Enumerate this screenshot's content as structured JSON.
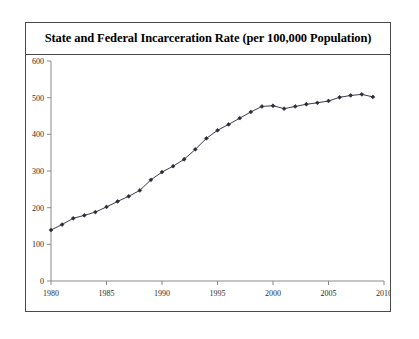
{
  "figure": {
    "title": "State and Federal Incarceration Rate (per 100,000 Population)",
    "frame_color": "#4a4a4a",
    "background": "#ffffff"
  },
  "chart_data": {
    "type": "line",
    "title": "State and Federal Incarceration Rate (per 100,000 Population)",
    "xlabel": "",
    "ylabel": "",
    "xlim": [
      1980,
      2010
    ],
    "ylim": [
      0,
      600
    ],
    "xticks": [
      1980,
      1985,
      1990,
      1995,
      2000,
      2005,
      2010
    ],
    "yticks": [
      0,
      100,
      200,
      300,
      400,
      500,
      600
    ],
    "grid": false,
    "legend": false,
    "marker": "diamond",
    "line_color": "#3a3a4a",
    "marker_color": "#2a2a38",
    "x": [
      1980,
      1981,
      1982,
      1983,
      1984,
      1985,
      1986,
      1987,
      1988,
      1989,
      1990,
      1991,
      1992,
      1993,
      1994,
      1995,
      1996,
      1997,
      1998,
      1999,
      2000,
      2001,
      2002,
      2003,
      2004,
      2005,
      2006,
      2007,
      2008,
      2009
    ],
    "values": [
      139,
      154,
      171,
      179,
      188,
      202,
      217,
      231,
      247,
      276,
      297,
      313,
      332,
      359,
      389,
      411,
      427,
      444,
      461,
      476,
      478,
      470,
      476,
      482,
      486,
      491,
      501,
      506,
      509,
      502
    ],
    "series": [
      {
        "name": "State and Federal Incarceration Rate",
        "values": [
          139,
          154,
          171,
          179,
          188,
          202,
          217,
          231,
          247,
          276,
          297,
          313,
          332,
          359,
          389,
          411,
          427,
          444,
          461,
          476,
          478,
          470,
          476,
          482,
          486,
          491,
          501,
          506,
          509,
          502
        ]
      }
    ]
  }
}
